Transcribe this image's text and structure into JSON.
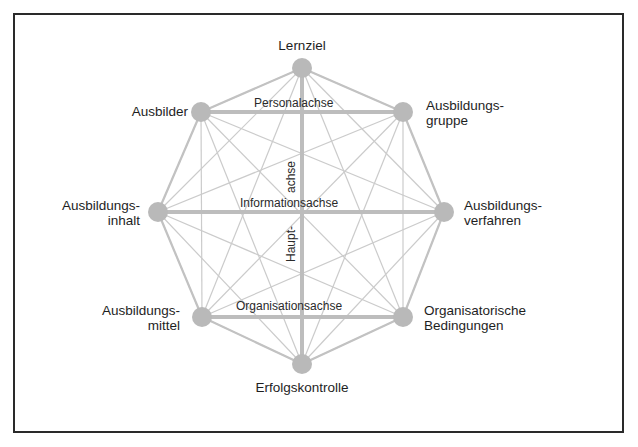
{
  "diagram": {
    "colors": {
      "frame": "#2a2a2a",
      "node": "#b9b9b9",
      "edge": "#c8c8c8",
      "axis": "#bdbdbd",
      "text": "#1e1e1e"
    },
    "nodes": [
      {
        "id": "lernziel",
        "label_lines": [
          "Lernziel"
        ],
        "x": 302,
        "y": 68
      },
      {
        "id": "ausbilder",
        "label_lines": [
          "Ausbilder"
        ],
        "x": 201,
        "y": 112
      },
      {
        "id": "ausbildungsgruppe",
        "label_lines": [
          "Ausbildungs-",
          "gruppe"
        ],
        "x": 403,
        "y": 112
      },
      {
        "id": "ausbildungsinhalt",
        "label_lines": [
          "Ausbildungs-",
          "inhalt"
        ],
        "x": 158,
        "y": 212
      },
      {
        "id": "ausbildungsverfahren",
        "label_lines": [
          "Ausbildungs-",
          "verfahren"
        ],
        "x": 444,
        "y": 212
      },
      {
        "id": "ausbildungsmittel",
        "label_lines": [
          "Ausbildungs-",
          "mittel"
        ],
        "x": 202,
        "y": 317
      },
      {
        "id": "organisatorische-bedingungen",
        "label_lines": [
          "Organisatorische",
          "Bedingungen"
        ],
        "x": 403,
        "y": 317
      },
      {
        "id": "erfolgskontrolle",
        "label_lines": [
          "Erfolgskontrolle"
        ],
        "x": 302,
        "y": 364
      }
    ],
    "labels": {
      "lernziel": "Lernziel",
      "ausbilder": "Ausbilder",
      "ausbildungsgruppe_1": "Ausbildungs-",
      "ausbildungsgruppe_2": "gruppe",
      "ausbildungsinhalt_1": "Ausbildungs-",
      "ausbildungsinhalt_2": "inhalt",
      "ausbildungsverfahren_1": "Ausbildungs-",
      "ausbildungsverfahren_2": "verfahren",
      "ausbildungsmittel_1": "Ausbildungs-",
      "ausbildungsmittel_2": "mittel",
      "organisatorische_1": "Organisatorische",
      "organisatorische_2": "Bedingungen",
      "erfolgskontrolle": "Erfolgskontrolle"
    },
    "axes": {
      "personal": "Personalachse",
      "information": "Informationsachse",
      "organisation": "Organisationsachse",
      "haupt_1": "Haupt-",
      "haupt_2": "achse"
    },
    "thick_axes": [
      [
        "lernziel",
        "erfolgskontrolle"
      ],
      [
        "ausbilder",
        "ausbildungsgruppe"
      ],
      [
        "ausbildungsinhalt",
        "ausbildungsverfahren"
      ],
      [
        "ausbildungsmittel",
        "organisatorische-bedingungen"
      ]
    ],
    "edge_rule": "complete graph between all 8 nodes (thin lines); octagon perimeter and axes emphasized"
  }
}
